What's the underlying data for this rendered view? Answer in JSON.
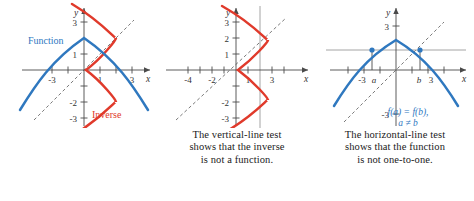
{
  "figure": {
    "title": "",
    "colors": {
      "function_blue": "#2f78bf",
      "inverse_red": "#e03a2b",
      "axis_gray": "#4a4a4a",
      "testline_gray": "#9a9a9a",
      "dash_gray": "#6b6b6b",
      "background": "#ffffff"
    }
  },
  "panels": [
    {
      "id": "panel-function-and-inverse",
      "axis": {
        "x_label": "x",
        "y_label": "y"
      },
      "x_ticklabels": [
        "-3",
        "1",
        "3"
      ],
      "y_ticklabels": [
        "3",
        "1",
        "-2",
        "-3"
      ],
      "labels": {
        "function": "Function",
        "inverse": "Inverse"
      },
      "caption": []
    },
    {
      "id": "panel-vertical-line-test",
      "axis": {
        "x_label": "x",
        "y_label": "y"
      },
      "x_ticklabels": [
        "-4",
        "-2",
        "1",
        "3"
      ],
      "y_ticklabels": [
        "3",
        "2",
        "1",
        "-2",
        "-3"
      ],
      "labels": {},
      "caption": [
        "The vertical-line test",
        "shows that the inverse",
        "is not a function."
      ]
    },
    {
      "id": "panel-horizontal-line-test",
      "axis": {
        "x_label": "x",
        "y_label": "y"
      },
      "x_ticklabels": [
        "-3",
        "a",
        "b",
        "3"
      ],
      "y_ticklabels": [
        "3",
        "-3"
      ],
      "labels": {
        "annotation_line1": "f(a) = f(b),",
        "annotation_line2": "a ≠ b"
      },
      "caption": [
        "The horizontal-line test",
        "shows that the function",
        "is not one-to-one."
      ]
    }
  ],
  "chart_data": [
    {
      "type": "line",
      "title": "Function and Inverse",
      "xlabel": "x",
      "ylabel": "y",
      "xlim": [
        -4.6,
        4.6
      ],
      "ylim": [
        -4.2,
        4.2
      ],
      "grid": false,
      "legend": [
        "Function",
        "Inverse"
      ],
      "series": [
        {
          "name": "Function",
          "color": "#2f78bf",
          "equation": "y = 2 - 0.33x^2",
          "points": [
            [
              -4.2,
              -3.8
            ],
            [
              -3,
              -1.0
            ],
            [
              -2,
              0.67
            ],
            [
              -1,
              1.67
            ],
            [
              0,
              2.0
            ],
            [
              1,
              1.67
            ],
            [
              2,
              0.67
            ],
            [
              3,
              -1.0
            ],
            [
              4.2,
              -3.8
            ]
          ]
        },
        {
          "name": "Inverse",
          "color": "#e03a2b",
          "equation": "x = 2 - 0.33y^2",
          "points": [
            [
              -3.8,
              -4.2
            ],
            [
              -1.0,
              -3
            ],
            [
              0.67,
              -2
            ],
            [
              1.67,
              -1
            ],
            [
              2.0,
              0
            ],
            [
              1.67,
              1
            ],
            [
              0.67,
              2
            ],
            [
              -1.0,
              3
            ],
            [
              -3.8,
              4.2
            ]
          ]
        },
        {
          "name": "y = x (dashed)",
          "color": "#6b6b6b",
          "style": "dashed",
          "points": [
            [
              -3.8,
              -3.8
            ],
            [
              3.8,
              3.8
            ]
          ]
        }
      ]
    },
    {
      "type": "line",
      "title": "Vertical-line test on the inverse",
      "xlabel": "x",
      "ylabel": "y",
      "xlim": [
        -5.2,
        4.4
      ],
      "ylim": [
        -4.4,
        4.4
      ],
      "grid": false,
      "legend": [],
      "series": [
        {
          "name": "Inverse",
          "color": "#e03a2b",
          "equation": "x = 2 - 0.33y^2",
          "points": [
            [
              -3.8,
              -4.2
            ],
            [
              -1.0,
              -3
            ],
            [
              0.67,
              -2
            ],
            [
              1.67,
              -1
            ],
            [
              2.0,
              0
            ],
            [
              1.67,
              1
            ],
            [
              0.67,
              2
            ],
            [
              -1.0,
              3
            ],
            [
              -3.8,
              4.2
            ]
          ]
        },
        {
          "name": "y = x (dashed)",
          "color": "#6b6b6b",
          "style": "dashed",
          "points": [
            [
              -3.8,
              -3.8
            ],
            [
              3.4,
              3.4
            ]
          ]
        },
        {
          "name": "vertical test line",
          "color": "#9a9a9a",
          "style": "solid",
          "points": [
            [
              1.5,
              -4.2
            ],
            [
              1.5,
              4.2
            ]
          ]
        }
      ]
    },
    {
      "type": "line",
      "title": "Horizontal-line test on the function",
      "xlabel": "x",
      "ylabel": "y",
      "xlim": [
        -4.6,
        4.6
      ],
      "ylim": [
        -4.2,
        4.2
      ],
      "grid": false,
      "legend": [],
      "annotations": [
        "f(a) = f(b),",
        "a ≠ b"
      ],
      "series": [
        {
          "name": "Function",
          "color": "#2f78bf",
          "equation": "y = 2 - 0.33x^2",
          "points": [
            [
              -4.2,
              -3.8
            ],
            [
              -3,
              -1.0
            ],
            [
              -2,
              0.67
            ],
            [
              -1,
              1.67
            ],
            [
              0,
              2.0
            ],
            [
              1,
              1.67
            ],
            [
              2,
              0.67
            ],
            [
              3,
              -1.0
            ],
            [
              4.2,
              -3.8
            ]
          ]
        },
        {
          "name": "y = x (dashed)",
          "color": "#6b6b6b",
          "style": "dashed",
          "points": [
            [
              -3.8,
              -3.8
            ],
            [
              3.4,
              3.4
            ]
          ]
        },
        {
          "name": "horizontal test line",
          "color": "#9a9a9a",
          "style": "solid",
          "points": [
            [
              -4.4,
              1.25
            ],
            [
              4.4,
              1.25
            ]
          ]
        }
      ],
      "marked_points": [
        {
          "label": "a",
          "x": -1.5,
          "y": 1.25
        },
        {
          "label": "b",
          "x": 1.5,
          "y": 1.25
        }
      ]
    }
  ]
}
